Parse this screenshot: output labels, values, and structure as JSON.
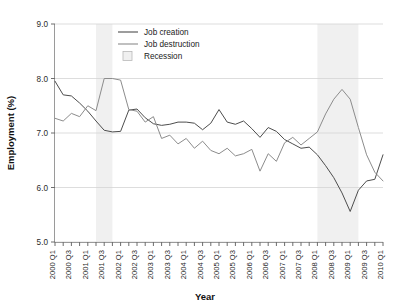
{
  "chart_data": {
    "type": "line",
    "title": "",
    "xlabel": "Year",
    "ylabel": "Employment (%)",
    "ylim": [
      5.0,
      9.0
    ],
    "ytick_values": [
      5.0,
      6.0,
      7.0,
      8.0,
      9.0
    ],
    "ytick_labels": [
      "5.0",
      "6.0",
      "7.0",
      "8.0",
      "9.0"
    ],
    "grid": true,
    "legend_position": "top-center",
    "x": [
      "2000 Q1",
      "2000 Q2",
      "2000 Q3",
      "2000 Q4",
      "2001 Q1",
      "2001 Q2",
      "2001 Q3",
      "2001 Q4",
      "2002 Q1",
      "2002 Q2",
      "2002 Q3",
      "2002 Q4",
      "2003 Q1",
      "2003 Q2",
      "2003 Q3",
      "2003 Q4",
      "2004 Q1",
      "2004 Q2",
      "2004 Q3",
      "2004 Q4",
      "2005 Q1",
      "2005 Q2",
      "2005 Q3",
      "2005 Q4",
      "2006 Q1",
      "2006 Q2",
      "2006 Q3",
      "2006 Q4",
      "2007 Q1",
      "2007 Q2",
      "2007 Q3",
      "2007 Q4",
      "2008 Q1",
      "2008 Q2",
      "2008 Q3",
      "2008 Q4",
      "2009 Q1",
      "2009 Q2",
      "2009 Q3",
      "2009 Q4",
      "2010 Q1"
    ],
    "xtick_labels_shown": [
      "2000 Q1",
      "2000 Q3",
      "2001 Q1",
      "2001 Q3",
      "2002 Q1",
      "2002 Q3",
      "2003 Q1",
      "2003 Q3",
      "2004 Q1",
      "2004 Q3",
      "2005 Q1",
      "2005 Q3",
      "2006 Q1",
      "2006 Q3",
      "2007 Q1",
      "2007 Q3",
      "2008 Q1",
      "2008 Q3",
      "2009 Q1",
      "2009 Q3",
      "2010 Q1"
    ],
    "series": [
      {
        "name": "Job creation",
        "color": "#4d4d4d",
        "values": [
          7.95,
          7.7,
          7.68,
          7.55,
          7.4,
          7.22,
          7.05,
          7.02,
          7.03,
          7.42,
          7.44,
          7.28,
          7.17,
          7.14,
          7.16,
          7.2,
          7.2,
          7.18,
          7.06,
          7.18,
          7.43,
          7.2,
          7.16,
          7.22,
          7.08,
          6.92,
          7.1,
          7.03,
          6.88,
          6.8,
          6.72,
          6.74,
          6.6,
          6.4,
          6.18,
          5.9,
          5.56,
          5.95,
          6.12,
          6.15,
          6.6
        ]
      },
      {
        "name": "Job destruction",
        "color": "#8c8c8c",
        "values": [
          7.27,
          7.22,
          7.36,
          7.3,
          7.5,
          7.41,
          8.0,
          8.0,
          7.97,
          7.43,
          7.4,
          7.2,
          7.3,
          6.9,
          6.96,
          6.8,
          6.9,
          6.72,
          6.85,
          6.68,
          6.62,
          6.72,
          6.58,
          6.62,
          6.7,
          6.3,
          6.62,
          6.48,
          6.82,
          6.92,
          6.78,
          6.9,
          7.02,
          7.35,
          7.62,
          7.8,
          7.62,
          7.1,
          6.6,
          6.28,
          6.12
        ]
      }
    ],
    "recessions": [
      {
        "label": "Recession",
        "start": "2001 Q2",
        "end": "2001 Q4"
      },
      {
        "label": "Recession",
        "start": "2008 Q1",
        "end": "2009 Q2"
      }
    ],
    "recession_color": "#f0f0f0"
  },
  "legend": {
    "items": [
      {
        "label": "Job creation",
        "type": "line",
        "color": "#4d4d4d"
      },
      {
        "label": "Job destruction",
        "type": "line",
        "color": "#8c8c8c"
      },
      {
        "label": "Recession",
        "type": "swatch",
        "color": "#f0f0f0"
      }
    ]
  }
}
